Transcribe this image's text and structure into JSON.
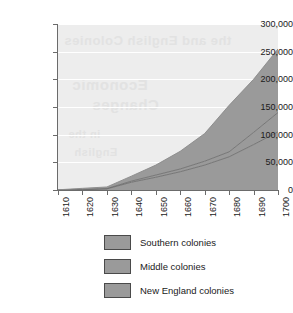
{
  "chart_data": {
    "type": "area",
    "stacked": true,
    "title": "",
    "subtitle": "",
    "xlabel": "",
    "ylabel": "",
    "x": [
      1610,
      1620,
      1630,
      1640,
      1650,
      1660,
      1670,
      1680,
      1690,
      1700
    ],
    "xlim": [
      1610,
      1700
    ],
    "ylim": [
      0,
      300000
    ],
    "ytick_labels": [
      "300,000",
      "250,000",
      "200,000",
      "150,000",
      "100,000",
      "50,000",
      "0"
    ],
    "ytick_values": [
      300000,
      250000,
      200000,
      150000,
      100000,
      50000,
      0
    ],
    "xtick_labels": [
      "1610",
      "1620",
      "1630",
      "1640",
      "1650",
      "1660",
      "1670",
      "1680",
      "1690",
      "1700"
    ],
    "grid": true,
    "grid_color": "#ffffff",
    "plot_bg_color": "#ededed",
    "legend_position": "bottom",
    "series": [
      {
        "name": "New England colonies",
        "color": "#9a9a9a",
        "values": [
          0,
          500,
          2000,
          14000,
          23000,
          33000,
          45000,
          60000,
          82000,
          105000
        ]
      },
      {
        "name": "Middle colonies",
        "color": "#9a9a9a",
        "values": [
          0,
          0,
          500,
          2000,
          4000,
          5000,
          7000,
          9000,
          22000,
          35000
        ]
      },
      {
        "name": "Southern colonies",
        "color": "#9a9a9a",
        "values": [
          350,
          2500,
          3000,
          9000,
          18000,
          32000,
          50000,
          84000,
          96000,
          115000
        ]
      }
    ],
    "totals": [
      350,
      3000,
      5500,
      25000,
      45000,
      70000,
      102000,
      153000,
      200000,
      255000
    ],
    "ghost_text": {
      "line1": "the and English Colonies",
      "line2": "Economic",
      "line3": "Changes",
      "line4": "in the",
      "line5": "English"
    }
  },
  "legend": {
    "items": [
      {
        "label": "Southern colonies",
        "color": "#9a9a9a"
      },
      {
        "label": "Middle colonies",
        "color": "#9a9a9a"
      },
      {
        "label": "New England colonies",
        "color": "#9a9a9a"
      }
    ]
  }
}
